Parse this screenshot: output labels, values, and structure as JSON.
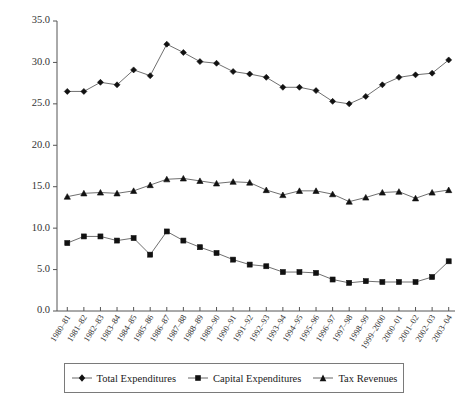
{
  "chart_data": {
    "type": "line",
    "title": "",
    "subtitle": "",
    "xlabel": "",
    "ylabel": "",
    "ylim": [
      0.0,
      35.0
    ],
    "yticks": [
      0.0,
      5.0,
      10.0,
      15.0,
      20.0,
      25.0,
      30.0,
      35.0
    ],
    "ytick_labels": [
      "0.0",
      "5.0",
      "10.0",
      "15.0",
      "20.0",
      "25.0",
      "30.0",
      "35.0"
    ],
    "grid": false,
    "legend_position": "below-plot",
    "categories": [
      "1980–81",
      "1981–82",
      "1982–83",
      "1983–84",
      "1984–85",
      "1985–86",
      "1986–87",
      "1987–88",
      "1988–89",
      "1989–90",
      "1990–91",
      "1991–92",
      "1992–93",
      "1993–94",
      "1994–95",
      "1995–96",
      "1996–97",
      "1997–98",
      "1998–99",
      "1999–2000",
      "2000–01",
      "2001–02",
      "2002–03",
      "2003–04"
    ],
    "series": [
      {
        "name": "Total Expenditures",
        "marker": "diamond",
        "color": "#111111",
        "values": [
          26.5,
          26.5,
          27.6,
          27.3,
          29.1,
          28.4,
          32.2,
          31.2,
          30.1,
          29.9,
          28.9,
          28.6,
          28.2,
          27.0,
          27.0,
          26.6,
          25.3,
          25.0,
          25.9,
          27.3,
          28.2,
          28.5,
          28.7,
          30.3
        ]
      },
      {
        "name": "Capital Expenditures",
        "marker": "square",
        "color": "#111111",
        "values": [
          8.2,
          9.0,
          9.0,
          8.5,
          8.8,
          6.8,
          9.6,
          8.5,
          7.7,
          7.0,
          6.2,
          5.6,
          5.4,
          4.7,
          4.7,
          4.6,
          3.8,
          3.4,
          3.6,
          3.5,
          3.5,
          3.5,
          4.1,
          6.0
        ]
      },
      {
        "name": "Tax Revenues",
        "marker": "triangle",
        "color": "#111111",
        "values": [
          13.8,
          14.2,
          14.3,
          14.2,
          14.5,
          15.2,
          15.9,
          16.0,
          15.7,
          15.4,
          15.6,
          15.5,
          14.6,
          14.0,
          14.5,
          14.5,
          14.1,
          13.2,
          13.7,
          14.3,
          14.4,
          13.6,
          14.3,
          14.6
        ]
      }
    ]
  },
  "legend": {
    "items": [
      {
        "label": "Total Expenditures",
        "marker": "diamond"
      },
      {
        "label": "Capital Expenditures",
        "marker": "square"
      },
      {
        "label": "Tax Revenues",
        "marker": "triangle"
      }
    ]
  },
  "caption": {
    "text": ""
  }
}
